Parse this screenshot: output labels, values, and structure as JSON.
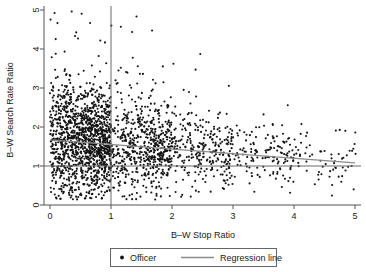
{
  "chart_data": {
    "type": "scatter",
    "title": "",
    "xlabel": "B–W Stop Ratio",
    "ylabel": "B–W Search Rate Ratio",
    "xlim": [
      -0.08,
      5.2
    ],
    "ylim": [
      -0.12,
      5.2
    ],
    "xticks": [
      "0",
      "1",
      "2",
      "3",
      "4",
      "5"
    ],
    "xtick_values": [
      0,
      1,
      2,
      3,
      4,
      5
    ],
    "yticks": [
      "0",
      "1",
      "2",
      "3",
      "4",
      "5"
    ],
    "ytick_values": [
      0,
      1,
      2,
      3,
      4,
      5
    ],
    "grid": false,
    "legend_position": "below-axes",
    "marker_color": "#141414",
    "marker_size_px": 2.1,
    "regression_color": "#8a8a8a",
    "reference_line_color": "#6b6b6b",
    "series": [
      {
        "name": "Officer",
        "type": "scatter",
        "marker": "dot",
        "n_points": 2400,
        "note": "Dense cloud of officer-level ratios; mass concentrated at x<1 with y between 0.5 and 2.5, thinning rightward toward y~1."
      },
      {
        "name": "Regression line",
        "type": "line",
        "x": [
          0,
          5
        ],
        "y": [
          1.67,
          1.08
        ],
        "slope": -0.118,
        "intercept": 1.67
      }
    ],
    "reference_lines": [
      {
        "orientation": "vertical",
        "value": 1
      },
      {
        "orientation": "horizontal",
        "value": 1
      }
    ],
    "annotations": []
  },
  "legend": {
    "officer_label": "Officer",
    "regression_label": "Regression line",
    "officer_marker": "dot-marker",
    "regression_marker": "line-marker"
  }
}
